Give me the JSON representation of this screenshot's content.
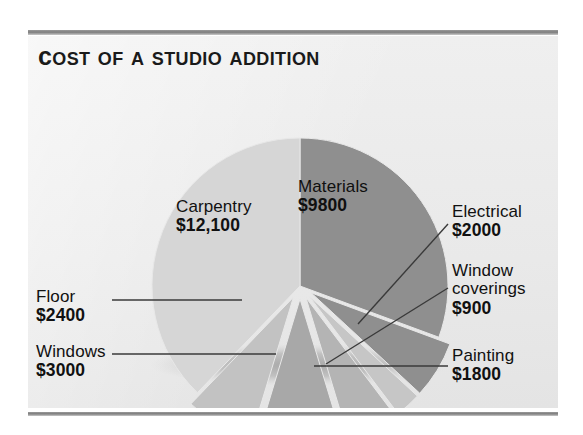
{
  "title": "Cost of a Studio Addition",
  "colors": {
    "panel_bg": "#ececec",
    "slice_light": "#d6d6d6",
    "slice_mid": "#b8b8b8",
    "slice_dark": "#8f8f8f",
    "leader_line": "#3a3a3a",
    "text": "#111111",
    "rule": "#7e7e7e"
  },
  "chart_data": {
    "type": "pie",
    "title": "Cost of a Studio Addition",
    "unit": "USD",
    "total": 32000,
    "legend_position": "callout-labels",
    "grid": false,
    "categories": [
      "Materials",
      "Electrical",
      "Window coverings",
      "Painting",
      "Windows",
      "Floor",
      "Carpentry"
    ],
    "values": [
      9800,
      2000,
      900,
      1800,
      3000,
      2400,
      12100
    ],
    "labels": [
      "$9800",
      "$2000",
      "$900",
      "$1800",
      "$3000",
      "$2400",
      "$12,100"
    ],
    "slices": [
      {
        "name": "Materials",
        "value": 9800,
        "label": "$9800",
        "shade": "#8f8f8f",
        "exploded": false
      },
      {
        "name": "Electrical",
        "value": 2000,
        "label": "$2000",
        "shade": "#8f8f8f",
        "exploded": true
      },
      {
        "name": "Window coverings",
        "value": 900,
        "label": "$900",
        "shade": "#c6c6c6",
        "exploded": true
      },
      {
        "name": "Painting",
        "value": 1800,
        "label": "$1800",
        "shade": "#b4b4b4",
        "exploded": true
      },
      {
        "name": "Windows",
        "value": 3000,
        "label": "$3000",
        "shade": "#a8a8a8",
        "exploded": true
      },
      {
        "name": "Floor",
        "value": 2400,
        "label": "$2400",
        "shade": "#c2c2c2",
        "exploded": true
      },
      {
        "name": "Carpentry",
        "value": 12100,
        "label": "$12,100",
        "shade": "#d6d6d6",
        "exploded": false
      }
    ]
  },
  "labels": {
    "carpentry": {
      "name": "Carpentry",
      "value": "$12,100"
    },
    "materials": {
      "name": "Materials",
      "value": "$9800"
    },
    "electrical": {
      "name": "Electrical",
      "value": "$2000"
    },
    "window_coverings": {
      "name_line1": "Window",
      "name_line2": "coverings",
      "value": "$900"
    },
    "painting": {
      "name": "Painting",
      "value": "$1800"
    },
    "floor": {
      "name": "Floor",
      "value": "$2400"
    },
    "windows": {
      "name": "Windows",
      "value": "$3000"
    }
  }
}
